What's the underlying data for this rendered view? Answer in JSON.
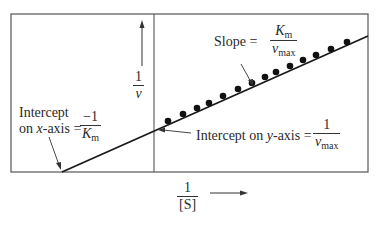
{
  "diagram": {
    "y_axis_label": {
      "numerator": "1",
      "denominator": "v"
    },
    "x_axis_label": {
      "numerator": "1",
      "denominator": "[S]"
    },
    "annotations": {
      "slope": {
        "prefix": "Slope =",
        "numerator": "K",
        "numerator_sub": "m",
        "denominator": "v",
        "denominator_sub": "max"
      },
      "x_intercept": {
        "line1": "Intercept",
        "line2_prefix": "on ",
        "line2_var": "x",
        "line2_suffix": "-axis =",
        "numerator": "−1",
        "denominator": "K",
        "denominator_sub": "m"
      },
      "y_intercept": {
        "prefix": "Intercept on ",
        "var": "y",
        "suffix": "-axis =",
        "numerator": "1",
        "denominator": "v",
        "denominator_sub": "max"
      }
    },
    "colors": {
      "line": "#1a1a1a",
      "frame": "#555555",
      "points": "#111111"
    },
    "points_px": [
      [
        168,
        121
      ],
      [
        183,
        114
      ],
      [
        197,
        108
      ],
      [
        209,
        103
      ],
      [
        223,
        96
      ],
      [
        238,
        89
      ],
      [
        252,
        83
      ],
      [
        265,
        77
      ],
      [
        276,
        72
      ],
      [
        290,
        66
      ],
      [
        303,
        60
      ],
      [
        316,
        55
      ],
      [
        331,
        49
      ],
      [
        347,
        42
      ]
    ]
  }
}
